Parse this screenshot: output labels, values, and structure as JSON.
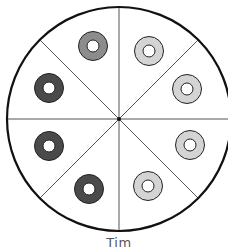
{
  "diagram": {
    "type": "fraction-circle",
    "label": "Tim",
    "slices": 8,
    "center": [
      119,
      119
    ],
    "radius": 112,
    "colors": {
      "outline": "#111111",
      "divider": "#555555",
      "dark": "#4a4a4a",
      "medium": "#8c8c8c",
      "light": "#d4d4d4",
      "hole": "#ffffff"
    },
    "donuts": [
      {
        "slice": 1,
        "x": 149,
        "y": 51,
        "shade": "light"
      },
      {
        "slice": 2,
        "x": 187,
        "y": 89,
        "shade": "light"
      },
      {
        "slice": 3,
        "x": 190,
        "y": 145,
        "shade": "light"
      },
      {
        "slice": 4,
        "x": 148,
        "y": 186,
        "shade": "light"
      },
      {
        "slice": 5,
        "x": 89,
        "y": 189,
        "shade": "dark"
      },
      {
        "slice": 6,
        "x": 49,
        "y": 146,
        "shade": "dark"
      },
      {
        "slice": 7,
        "x": 49,
        "y": 88,
        "shade": "dark"
      },
      {
        "slice": 8,
        "x": 93,
        "y": 46,
        "shade": "medium"
      }
    ]
  }
}
